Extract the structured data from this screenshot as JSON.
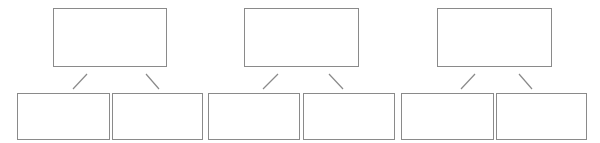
{
  "diagram": {
    "type": "tree-templates",
    "background": "#ffffff",
    "border_color": "#8a8a8a",
    "line_color": "#8a8a8a",
    "groups": [
      {
        "parent": {
          "label": "",
          "x": 53,
          "y": 8,
          "w": 114,
          "h": 59
        },
        "children": [
          {
            "label": "",
            "x": 17,
            "y": 93,
            "w": 93,
            "h": 47
          },
          {
            "label": "",
            "x": 112,
            "y": 93,
            "w": 91,
            "h": 47
          }
        ],
        "connectors": [
          {
            "x1": 87,
            "y1": 74,
            "x2": 73,
            "y2": 89
          },
          {
            "x1": 146,
            "y1": 74,
            "x2": 159,
            "y2": 89
          }
        ]
      },
      {
        "parent": {
          "label": "",
          "x": 244,
          "y": 8,
          "w": 115,
          "h": 59
        },
        "children": [
          {
            "label": "",
            "x": 208,
            "y": 93,
            "w": 92,
            "h": 47
          },
          {
            "label": "",
            "x": 303,
            "y": 93,
            "w": 92,
            "h": 47
          }
        ],
        "connectors": [
          {
            "x1": 278,
            "y1": 74,
            "x2": 263,
            "y2": 89
          },
          {
            "x1": 329,
            "y1": 74,
            "x2": 343,
            "y2": 89
          }
        ]
      },
      {
        "parent": {
          "label": "",
          "x": 437,
          "y": 8,
          "w": 115,
          "h": 59
        },
        "children": [
          {
            "label": "",
            "x": 401,
            "y": 93,
            "w": 93,
            "h": 47
          },
          {
            "label": "",
            "x": 496,
            "y": 93,
            "w": 91,
            "h": 47
          }
        ],
        "connectors": [
          {
            "x1": 475,
            "y1": 74,
            "x2": 461,
            "y2": 89
          },
          {
            "x1": 519,
            "y1": 74,
            "x2": 532,
            "y2": 89
          }
        ]
      }
    ]
  }
}
